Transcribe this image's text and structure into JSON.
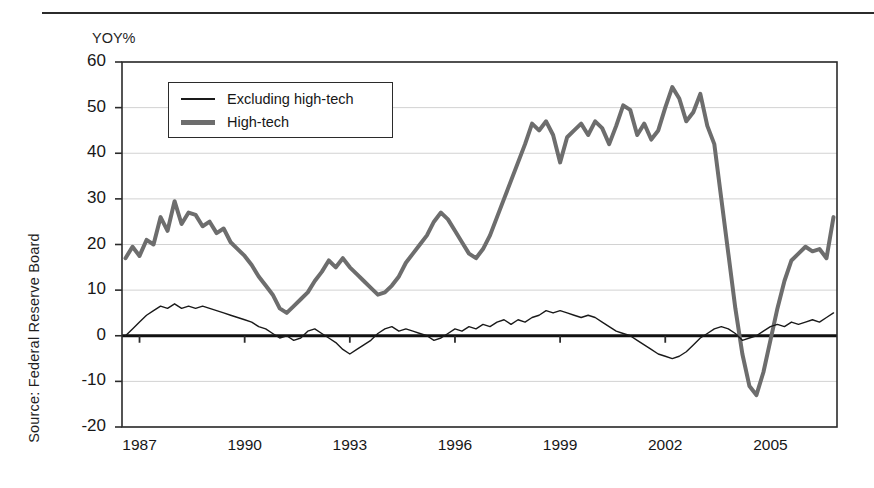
{
  "figure": {
    "source_note": "Source: Federal Reserve Board",
    "unit_label": "YOY%"
  },
  "legend": {
    "position": "top-left-inside",
    "entries": [
      {
        "label": "Excluding high-tech",
        "style": "thin-black-line",
        "color": "#1a1a1a"
      },
      {
        "label": "High-tech",
        "style": "thick-gray-line",
        "color": "#6d6d6d"
      }
    ]
  },
  "axes": {
    "y_ticks": [
      "60",
      "50",
      "40",
      "30",
      "20",
      "10",
      "0",
      "-10",
      "-20"
    ],
    "x_ticks": [
      "1987",
      "1990",
      "1993",
      "1996",
      "1999",
      "2002",
      "2005"
    ]
  },
  "colors": {
    "high_tech": "#6d6d6d",
    "excluding_high_tech": "#1a1a1a",
    "gridline": "#d2d2d2",
    "axis": "#2b2b2b",
    "zero_line": "#111111",
    "background": "#ffffff"
  },
  "chart_data": {
    "type": "line",
    "title": "",
    "subtitle": "",
    "xlabel": "",
    "ylabel": "YOY%",
    "ylim": [
      -20,
      60
    ],
    "xlim": [
      1986.5,
      2006.9
    ],
    "grid": true,
    "y_ticks": [
      -20,
      -10,
      0,
      10,
      20,
      30,
      40,
      50,
      60
    ],
    "x_ticks": [
      1987,
      1990,
      1993,
      1996,
      1999,
      2002,
      2005
    ],
    "legend_position": "upper left (inside plot)",
    "annotations": [
      "Zero reference line drawn heavy at y = 0"
    ],
    "series": [
      {
        "name": "High-tech",
        "color": "#6d6d6d",
        "linewidth": 4,
        "x": [
          1986.6,
          1986.8,
          1987.0,
          1987.2,
          1987.4,
          1987.6,
          1987.8,
          1988.0,
          1988.2,
          1988.4,
          1988.6,
          1988.8,
          1989.0,
          1989.2,
          1989.4,
          1989.6,
          1989.8,
          1990.0,
          1990.2,
          1990.4,
          1990.6,
          1990.8,
          1991.0,
          1991.2,
          1991.4,
          1991.6,
          1991.8,
          1992.0,
          1992.2,
          1992.4,
          1992.6,
          1992.8,
          1993.0,
          1993.2,
          1993.4,
          1993.6,
          1993.8,
          1994.0,
          1994.2,
          1994.4,
          1994.6,
          1994.8,
          1995.0,
          1995.2,
          1995.4,
          1995.6,
          1995.8,
          1996.0,
          1996.2,
          1996.4,
          1996.6,
          1996.8,
          1997.0,
          1997.2,
          1997.4,
          1997.6,
          1997.8,
          1998.0,
          1998.2,
          1998.4,
          1998.6,
          1998.8,
          1999.0,
          1999.2,
          1999.4,
          1999.6,
          1999.8,
          2000.0,
          2000.2,
          2000.4,
          2000.6,
          2000.8,
          2001.0,
          2001.2,
          2001.4,
          2001.6,
          2001.8,
          2002.0,
          2002.2,
          2002.4,
          2002.6,
          2002.8,
          2003.0,
          2003.2,
          2003.4,
          2003.6,
          2003.8,
          2004.0,
          2004.2,
          2004.4,
          2004.6,
          2004.8,
          2005.0,
          2005.2,
          2005.4,
          2005.6,
          2005.8,
          2006.0,
          2006.2,
          2006.4,
          2006.6,
          2006.8
        ],
        "y": [
          17.0,
          19.5,
          17.5,
          21.0,
          20.0,
          26.0,
          23.0,
          29.5,
          24.5,
          27.0,
          26.5,
          24.0,
          25.0,
          22.5,
          23.5,
          20.5,
          19.0,
          17.5,
          15.5,
          13.0,
          11.0,
          9.0,
          6.0,
          5.0,
          6.5,
          8.0,
          9.5,
          12.0,
          14.0,
          16.5,
          15.0,
          17.0,
          15.0,
          13.5,
          12.0,
          10.5,
          9.0,
          9.5,
          11.0,
          13.0,
          16.0,
          18.0,
          20.0,
          22.0,
          25.0,
          27.0,
          25.5,
          23.0,
          20.5,
          18.0,
          17.0,
          19.0,
          22.0,
          26.0,
          30.0,
          34.0,
          38.0,
          42.0,
          46.5,
          45.0,
          47.0,
          44.0,
          38.0,
          43.5,
          45.0,
          46.5,
          44.0,
          47.0,
          45.5,
          42.0,
          46.0,
          50.5,
          49.5,
          44.0,
          46.5,
          43.0,
          45.0,
          50.0,
          54.5,
          52.0,
          47.0,
          49.0,
          53.0,
          46.0,
          42.0,
          30.0,
          18.0,
          6.0,
          -4.0,
          -11.0,
          -13.0,
          -8.0,
          -1.0,
          6.0,
          12.0,
          16.5,
          18.0,
          19.5,
          18.5,
          19.0,
          17.0,
          26.0
        ],
        "note_keypoints": {
          "1988_peak": 29.5,
          "1991_trough": 5.0,
          "2000_peak": 54.5,
          "2001_crash_trough": -13.0,
          "2006_level": 26.0
        }
      },
      {
        "name": "Excluding high-tech",
        "color": "#1a1a1a",
        "linewidth": 1.4,
        "x": [
          1986.6,
          1986.8,
          1987.0,
          1987.2,
          1987.4,
          1987.6,
          1987.8,
          1988.0,
          1988.2,
          1988.4,
          1988.6,
          1988.8,
          1989.0,
          1989.2,
          1989.4,
          1989.6,
          1989.8,
          1990.0,
          1990.2,
          1990.4,
          1990.6,
          1990.8,
          1991.0,
          1991.2,
          1991.4,
          1991.6,
          1991.8,
          1992.0,
          1992.2,
          1992.4,
          1992.6,
          1992.8,
          1993.0,
          1993.2,
          1993.4,
          1993.6,
          1993.8,
          1994.0,
          1994.2,
          1994.4,
          1994.6,
          1994.8,
          1995.0,
          1995.2,
          1995.4,
          1995.6,
          1995.8,
          1996.0,
          1996.2,
          1996.4,
          1996.6,
          1996.8,
          1997.0,
          1997.2,
          1997.4,
          1997.6,
          1997.8,
          1998.0,
          1998.2,
          1998.4,
          1998.6,
          1998.8,
          1999.0,
          1999.2,
          1999.4,
          1999.6,
          1999.8,
          2000.0,
          2000.2,
          2000.4,
          2000.6,
          2000.8,
          2001.0,
          2001.2,
          2001.4,
          2001.6,
          2001.8,
          2002.0,
          2002.2,
          2002.4,
          2002.6,
          2002.8,
          2003.0,
          2003.2,
          2003.4,
          2003.6,
          2003.8,
          2004.0,
          2004.2,
          2004.4,
          2004.6,
          2004.8,
          2005.0,
          2005.2,
          2005.4,
          2005.6,
          2005.8,
          2006.0,
          2006.2,
          2006.4,
          2006.6,
          2006.8
        ],
        "y": [
          0.0,
          1.5,
          3.0,
          4.5,
          5.5,
          6.5,
          6.0,
          7.0,
          6.0,
          6.5,
          6.0,
          6.5,
          6.0,
          5.5,
          5.0,
          4.5,
          4.0,
          3.5,
          3.0,
          2.0,
          1.5,
          0.5,
          -0.5,
          0.0,
          -1.0,
          -0.5,
          1.0,
          1.5,
          0.5,
          -0.5,
          -1.5,
          -3.0,
          -4.0,
          -3.0,
          -2.0,
          -1.0,
          0.5,
          1.5,
          2.0,
          1.0,
          1.5,
          1.0,
          0.5,
          0.0,
          -1.0,
          -0.5,
          0.5,
          1.5,
          1.0,
          2.0,
          1.5,
          2.5,
          2.0,
          3.0,
          3.5,
          2.5,
          3.5,
          3.0,
          4.0,
          4.5,
          5.5,
          5.0,
          5.5,
          5.0,
          4.5,
          4.0,
          4.5,
          4.0,
          3.0,
          2.0,
          1.0,
          0.5,
          0.0,
          -1.0,
          -2.0,
          -3.0,
          -4.0,
          -4.5,
          -5.0,
          -4.5,
          -3.5,
          -2.0,
          -0.5,
          0.5,
          1.5,
          2.0,
          1.5,
          0.5,
          -1.0,
          -0.5,
          0.0,
          1.0,
          2.0,
          2.5,
          2.0,
          3.0,
          2.5,
          3.0,
          3.5,
          3.0,
          4.0,
          5.0
        ],
        "note_keypoints": {
          "1988_peak": 7.0,
          "1993_trough": -4.0,
          "1998_peak": 5.5,
          "2002_trough": -5.0,
          "2006_level": 5.0
        }
      }
    ]
  }
}
